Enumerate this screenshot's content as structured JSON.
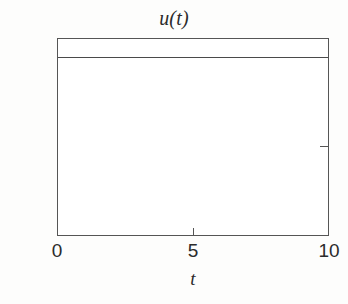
{
  "chart_data": {
    "type": "line",
    "title": "u(t)",
    "xlabel": "t",
    "ylabel": "",
    "xlim": [
      0,
      10
    ],
    "ylim": [
      0,
      1.1
    ],
    "grid": false,
    "legend": null,
    "xticks": [
      {
        "value": 0,
        "label": "0"
      },
      {
        "value": 5,
        "label": "5"
      },
      {
        "value": 10,
        "label": "10"
      }
    ],
    "yticks": [
      {
        "value": 0,
        "label": "0"
      },
      {
        "value": 0.5,
        "label": "0.5"
      },
      {
        "value": 1,
        "label": "1"
      }
    ],
    "series": [
      {
        "name": "u(t)",
        "x": [
          0,
          1,
          2,
          3,
          4,
          5,
          6,
          7,
          8,
          9,
          10
        ],
        "values": [
          1,
          1,
          1,
          1,
          1,
          1,
          1,
          1,
          1,
          1,
          1
        ],
        "constant_value": 1,
        "color": "#4a4a4a"
      }
    ],
    "annotations": [],
    "axis_color": "#555555",
    "background_color": "#fdfdfc",
    "plot_background_color": "#ffffff"
  }
}
